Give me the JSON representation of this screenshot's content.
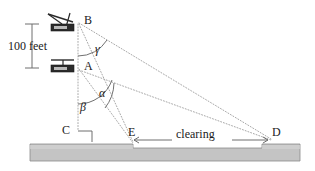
{
  "figure": {
    "type": "geometry-diagram",
    "background_color": "#ffffff",
    "line_color": "#9a9a9a",
    "ground_fill": "#c4c4c4",
    "ground_stroke": "#8a8a8a",
    "text_color": "#1a1a1a"
  },
  "points": {
    "B": {
      "label": "B",
      "x": 78,
      "y": 22
    },
    "A": {
      "label": "A",
      "x": 78,
      "y": 68
    },
    "C": {
      "label": "C",
      "x": 78,
      "y": 132
    },
    "E": {
      "label": "E",
      "x": 133,
      "y": 140
    },
    "D": {
      "label": "D",
      "x": 272,
      "y": 140
    }
  },
  "angles": {
    "gamma": {
      "label": "γ",
      "vertex": "B",
      "between": [
        "B-A vertical",
        "B-D sight line"
      ]
    },
    "alpha": {
      "label": "α",
      "vertex": "A",
      "between": [
        "A-E sight line",
        "A-D sight line"
      ]
    },
    "beta": {
      "label": "β",
      "vertex": "A",
      "between": [
        "A-C vertical",
        "A-D sight line"
      ]
    }
  },
  "dimensions": {
    "vertical": {
      "label": "100 feet",
      "from": "A",
      "to": "B"
    }
  },
  "ground": {
    "clearing_label": "clearing",
    "clearing_from": "E",
    "clearing_to": "D"
  },
  "icons": {
    "station_b": "theodolite-icon",
    "station_a": "theodolite-icon",
    "right_angle_c": "right-angle-mark-icon"
  }
}
